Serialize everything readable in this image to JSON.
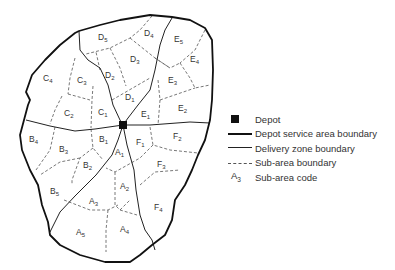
{
  "diagram": {
    "type": "depot service area map",
    "depot": {
      "label": "Depot",
      "x": 123,
      "y": 125
    },
    "zones": [
      "A",
      "B",
      "C",
      "D",
      "E",
      "F"
    ],
    "subarea_labels": [
      {
        "zone": "D",
        "n": "5",
        "x": 102,
        "y": 38
      },
      {
        "zone": "D",
        "n": "4",
        "x": 146,
        "y": 35
      },
      {
        "zone": "E",
        "n": "5",
        "x": 176,
        "y": 40
      },
      {
        "zone": "E",
        "n": "4",
        "x": 192,
        "y": 60
      },
      {
        "zone": "D",
        "n": "3",
        "x": 133,
        "y": 61
      },
      {
        "zone": "C",
        "n": "4",
        "x": 47,
        "y": 78
      },
      {
        "zone": "C",
        "n": "3",
        "x": 81,
        "y": 80
      },
      {
        "zone": "D",
        "n": "2",
        "x": 108,
        "y": 75
      },
      {
        "zone": "E",
        "n": "3",
        "x": 171,
        "y": 80
      },
      {
        "zone": "D",
        "n": "1",
        "x": 127,
        "y": 98
      },
      {
        "zone": "C",
        "n": "2",
        "x": 68,
        "y": 114
      },
      {
        "zone": "C",
        "n": "1",
        "x": 100,
        "y": 112
      },
      {
        "zone": "E",
        "n": "1",
        "x": 144,
        "y": 114
      },
      {
        "zone": "E",
        "n": "2",
        "x": 180,
        "y": 108
      },
      {
        "zone": "B",
        "n": "4",
        "x": 31,
        "y": 140
      },
      {
        "zone": "B",
        "n": "1",
        "x": 102,
        "y": 140
      },
      {
        "zone": "F",
        "n": "1",
        "x": 139,
        "y": 142
      },
      {
        "zone": "F",
        "n": "2",
        "x": 175,
        "y": 137
      },
      {
        "zone": "B",
        "n": "3",
        "x": 61,
        "y": 150
      },
      {
        "zone": "A",
        "n": "1",
        "x": 117,
        "y": 153
      },
      {
        "zone": "B",
        "n": "2",
        "x": 85,
        "y": 167
      },
      {
        "zone": "F",
        "n": "3",
        "x": 159,
        "y": 165
      },
      {
        "zone": "A",
        "n": "2",
        "x": 122,
        "y": 187
      },
      {
        "zone": "B",
        "n": "5",
        "x": 52,
        "y": 192
      },
      {
        "zone": "A",
        "n": "3",
        "x": 91,
        "y": 202
      },
      {
        "zone": "F",
        "n": "4",
        "x": 156,
        "y": 208
      },
      {
        "zone": "A",
        "n": "5",
        "x": 78,
        "y": 233
      },
      {
        "zone": "A",
        "n": "4",
        "x": 122,
        "y": 230
      }
    ]
  },
  "legend": {
    "depot": "Depot",
    "service_area": "Depot service area boundary",
    "delivery_zone": "Delivery zone boundary",
    "sub_area": "Sub-area boundary",
    "sub_area_code": "Sub-area code",
    "code_example_letter": "A",
    "code_example_number": "3"
  }
}
